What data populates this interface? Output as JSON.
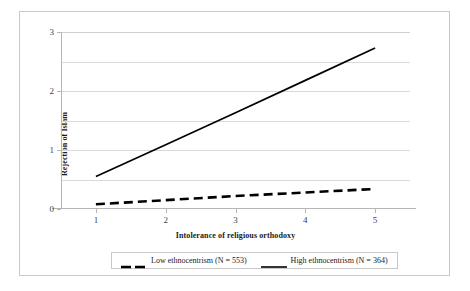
{
  "chart_data": {
    "type": "line",
    "title": "",
    "xlabel": "Intolerance of religious orthodoxy",
    "ylabel": "Rejection of Islam",
    "xlim": [
      0.5,
      5.5
    ],
    "ylim": [
      0,
      3
    ],
    "x": [
      1,
      2,
      3,
      4,
      5
    ],
    "xticks": [
      "1",
      "2",
      "3",
      "4",
      "5"
    ],
    "yticks": [
      "0",
      "1",
      "2",
      "3"
    ],
    "ytick_values": [
      0,
      1,
      2,
      3
    ],
    "gridlines_y": [
      0,
      0.5,
      1,
      1.5,
      2,
      2.5,
      3
    ],
    "grid": "horizontal",
    "legend_position": "bottom",
    "series": [
      {
        "name": "Low ethnocentrism (N = 553)",
        "style": "dashed",
        "color": "#000000",
        "values": [
          0.08,
          0.15,
          0.22,
          0.28,
          0.34
        ]
      },
      {
        "name": "High ethnocentrism (N = 364)",
        "style": "solid",
        "color": "#000000",
        "values": [
          0.55,
          1.09,
          1.63,
          2.18,
          2.73
        ]
      }
    ]
  },
  "legend": {
    "entries": [
      {
        "label": "Low ethnocentrism (N = 553)",
        "style": "dashed"
      },
      {
        "label": "High ethnocentrism (N = 364)",
        "style": "solid"
      }
    ]
  },
  "axes": {
    "x_title": "Intolerance of religious orthodoxy",
    "y_title": "Rejection of Islam"
  },
  "colors": {
    "series_line": "#000000",
    "gridline": "#d9d9d9",
    "axis_line": "#b5b5b5",
    "frame_border": "#c8c8c8",
    "tick_text": "#3f3f3f",
    "title_text": "#1a1a1a",
    "background": "#ffffff"
  }
}
